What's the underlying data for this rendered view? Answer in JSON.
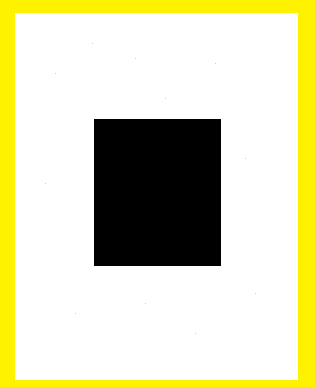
{
  "colors": {
    "border": "#fef200",
    "paper": "#ffffff",
    "shape": "#000000"
  },
  "shape": {
    "type": "rectangle",
    "x": 94,
    "y": 119,
    "width": 127,
    "height": 147
  }
}
